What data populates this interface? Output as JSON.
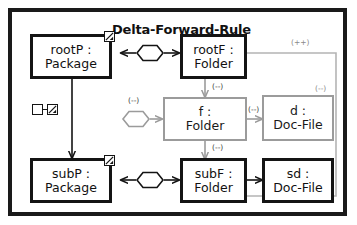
{
  "diagram": {
    "title": "Delta-Forward-Rule",
    "frame_name": "rule-frame"
  },
  "nodes": [
    {
      "id": "rootP",
      "name": "rootP :",
      "type": "Package",
      "style": "black",
      "badge": "checked-box-icon"
    },
    {
      "id": "rootF",
      "name": "rootF :",
      "type": "Folder",
      "style": "black",
      "badge": null
    },
    {
      "id": "subP",
      "name": "subP :",
      "type": "Package",
      "style": "black",
      "badge": "checked-box-icon"
    },
    {
      "id": "f",
      "name": "f :",
      "type": "Folder",
      "style": "gray",
      "badge": null
    },
    {
      "id": "subF",
      "name": "subF :",
      "type": "Folder",
      "style": "black",
      "badge": null
    },
    {
      "id": "d",
      "name": "d :",
      "type": "Doc-File",
      "style": "gray",
      "badge": null
    },
    {
      "id": "sd",
      "name": "sd :",
      "type": "Doc-File",
      "style": "black",
      "badge": null
    }
  ],
  "edge_labels": {
    "root_to_right": "(++)",
    "rootF_to_f": "(--)",
    "f_hexagon": "(--)",
    "f_to_d": "(--)",
    "d_top": "(--)",
    "f_to_subF": "(--)"
  },
  "markers": {
    "create_marker": "empty-box-to-checked-box"
  },
  "links": [
    {
      "from": "rootP",
      "to": "rootF",
      "kind": "correspondence-hexagon",
      "style": "black"
    },
    {
      "from": "subP",
      "to": "subF",
      "kind": "correspondence-hexagon",
      "style": "black"
    },
    {
      "from": "hex-f",
      "to": "f",
      "kind": "correspondence-hexagon",
      "style": "gray"
    },
    {
      "from": "rootP",
      "to": "subP",
      "kind": "containment-arrow",
      "style": "black"
    },
    {
      "from": "rootF",
      "to": "f",
      "kind": "containment-arrow",
      "style": "gray"
    },
    {
      "from": "f",
      "to": "subF",
      "kind": "containment-arrow",
      "style": "gray"
    },
    {
      "from": "f",
      "to": "d",
      "kind": "containment-arrow",
      "style": "gray"
    },
    {
      "from": "subF",
      "to": "sd",
      "kind": "containment-arrow",
      "style": "black"
    },
    {
      "from": "rootF",
      "to": "subF",
      "kind": "loop-arrow-right",
      "style": "gray"
    }
  ],
  "colors": {
    "stroke_black": "#141414",
    "stroke_gray": "#9b9b9b",
    "background": "#ffffff",
    "label": "#3a3a3a"
  }
}
